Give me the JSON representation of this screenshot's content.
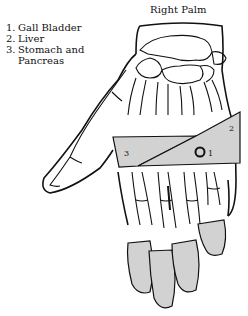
{
  "title": "Right Palm",
  "legend": [
    {
      "number": "1.",
      "label": "Gall Bladder"
    },
    {
      "number": "2.",
      "label": "Liver"
    },
    {
      "number": "3.",
      "label": "Stomach and",
      "continuation": "Pancreas"
    }
  ],
  "zones": [
    {
      "id": "1",
      "label": "1",
      "name": "Gall Bladder"
    },
    {
      "id": "2",
      "label": "2",
      "name": "Liver"
    },
    {
      "id": "3",
      "label": "3",
      "name": "Stomach and Pancreas"
    }
  ],
  "colors": {
    "zone_fill": "#d2d2d2",
    "line": "#111111",
    "background": "#ffffff"
  }
}
